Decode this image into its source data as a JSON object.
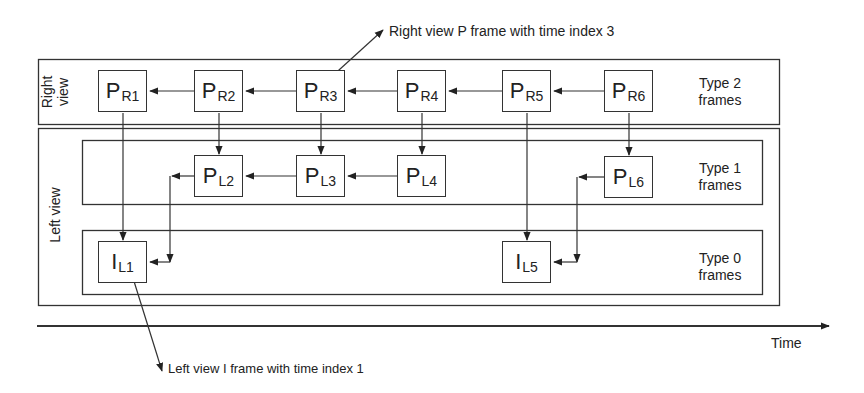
{
  "diagram": {
    "views": {
      "right": {
        "label_line1": "Right",
        "label_line2": "view"
      },
      "left": {
        "label": "Left view"
      }
    },
    "type_labels": {
      "type2": {
        "line1": "Type 2",
        "line2": "frames"
      },
      "type1": {
        "line1": "Type 1",
        "line2": "frames"
      },
      "type0": {
        "line1": "Type 0",
        "line2": "frames"
      }
    },
    "frames": {
      "PR1": {
        "main": "P",
        "sub": "R1"
      },
      "PR2": {
        "main": "P",
        "sub": "R2"
      },
      "PR3": {
        "main": "P",
        "sub": "R3"
      },
      "PR4": {
        "main": "P",
        "sub": "R4"
      },
      "PR5": {
        "main": "P",
        "sub": "R5"
      },
      "PR6": {
        "main": "P",
        "sub": "R6"
      },
      "PL2": {
        "main": "P",
        "sub": "L2"
      },
      "PL3": {
        "main": "P",
        "sub": "L3"
      },
      "PL4": {
        "main": "P",
        "sub": "L4"
      },
      "PL6": {
        "main": "P",
        "sub": "L6"
      },
      "IL1": {
        "main": "I",
        "sub": "L1"
      },
      "IL5": {
        "main": "I",
        "sub": "L5"
      }
    },
    "annotations": {
      "top": "Right view P frame with time index 3",
      "bottom": "Left view I frame with time index 1"
    },
    "axis": {
      "label": "Time"
    },
    "colors": {
      "line": "#333333",
      "background": "#ffffff"
    }
  }
}
